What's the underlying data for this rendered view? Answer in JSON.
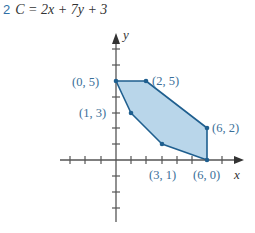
{
  "problem": {
    "number": "2",
    "equation": "C = 2x + 7y + 3"
  },
  "graph": {
    "x_axis_label": "x",
    "y_axis_label": "y",
    "region_fill": "#b9d6ea",
    "edge_color": "#1f5f8f",
    "vertices": [
      {
        "label": "(0, 5)",
        "x": 0,
        "y": 5
      },
      {
        "label": "(2, 5)",
        "x": 2,
        "y": 5
      },
      {
        "label": "(6, 2)",
        "x": 6,
        "y": 2
      },
      {
        "label": "(6, 0)",
        "x": 6,
        "y": 0
      },
      {
        "label": "(3, 1)",
        "x": 3,
        "y": 1
      },
      {
        "label": "(1, 3)",
        "x": 1,
        "y": 3
      }
    ]
  }
}
